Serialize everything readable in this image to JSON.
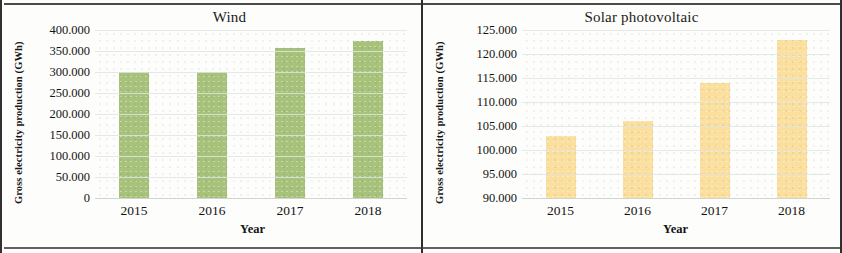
{
  "figure": {
    "panels": [
      "wind",
      "solar"
    ],
    "frame_color": "#2e2e2e"
  },
  "chart_data": [
    {
      "type": "bar",
      "title": "Wind",
      "xlabel": "Year",
      "ylabel": "Gross electricity production (GWh)",
      "categories": [
        "2015",
        "2016",
        "2017",
        "2018"
      ],
      "values": [
        300000,
        300000,
        357000,
        373000
      ],
      "ylim": [
        0,
        400000
      ],
      "ytick_step": 50000,
      "ytick_labels": [
        "400.000",
        "350.000",
        "300.000",
        "250.000",
        "200.000",
        "150.000",
        "100.000",
        "50.000",
        "0"
      ],
      "ytick_values": [
        400000,
        350000,
        300000,
        250000,
        200000,
        150000,
        100000,
        50000,
        0
      ],
      "bar_color": "#a7c37b",
      "grid": true,
      "legend": "none"
    },
    {
      "type": "bar",
      "title": "Solar photovoltaic",
      "xlabel": "Year",
      "ylabel": "Gross electricity production (GWh)",
      "categories": [
        "2015",
        "2016",
        "2017",
        "2018"
      ],
      "values": [
        103000,
        106000,
        114000,
        123000
      ],
      "ylim": [
        90000,
        125000
      ],
      "ytick_step": 5000,
      "ytick_labels": [
        "125.000",
        "120.000",
        "115.000",
        "110.000",
        "105.000",
        "100.000",
        "95.000",
        "90.000"
      ],
      "ytick_values": [
        125000,
        120000,
        115000,
        110000,
        105000,
        100000,
        95000,
        90000
      ],
      "bar_color": "#fadf9e",
      "grid": true,
      "legend": "none"
    }
  ]
}
